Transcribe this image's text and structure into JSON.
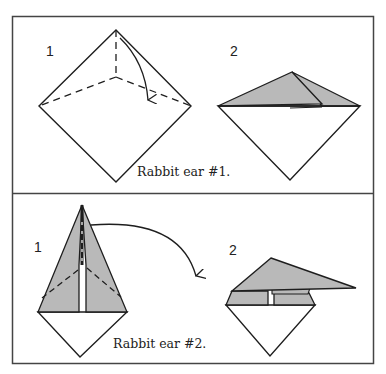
{
  "figure": {
    "colors": {
      "line": "#1e1e1e",
      "fold_fill": "#b9b9b9",
      "paper": "#ffffff",
      "border": "#444444"
    },
    "panels": [
      {
        "caption": "Rabbit ear #1.",
        "steps": [
          {
            "label": "1",
            "description": "square diamond with valley-fold dashed lines from top corner to center and from center to side corners; curved arrow folding top down"
          },
          {
            "label": "2",
            "description": "top half folded down into gray rabbit ear flap"
          }
        ]
      },
      {
        "caption": "Rabbit ear #2.",
        "steps": [
          {
            "label": "1",
            "description": "kite shape with gray flaps and dashed fold lines; curved arrow folding tip to the right"
          },
          {
            "label": "2",
            "description": "tip folded down to the right forming gray rabbit ear"
          }
        ]
      }
    ]
  }
}
